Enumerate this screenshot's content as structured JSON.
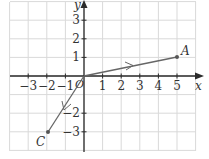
{
  "diagram": {
    "type": "coordinate-plane-vectors",
    "axes": {
      "x_label": "x",
      "y_label": "y",
      "x_ticks": [
        {
          "value": -3,
          "label": "−3"
        },
        {
          "value": -2,
          "label": "−2"
        },
        {
          "value": -1,
          "label": "−1"
        },
        {
          "value": 1,
          "label": "1"
        },
        {
          "value": 2,
          "label": "2"
        },
        {
          "value": 3,
          "label": "3"
        },
        {
          "value": 4,
          "label": "4"
        },
        {
          "value": 5,
          "label": "5"
        }
      ],
      "y_ticks": [
        {
          "value": 3,
          "label": "3"
        },
        {
          "value": 2,
          "label": "2"
        },
        {
          "value": 1,
          "label": "1"
        },
        {
          "value": -2,
          "label": "−2"
        },
        {
          "value": -3,
          "label": "−3"
        }
      ],
      "origin_label": "O",
      "x_range": [
        -4,
        6
      ],
      "y_range": [
        -4,
        4
      ]
    },
    "points": [
      {
        "name": "A",
        "x": 5,
        "y": 1
      },
      {
        "name": "C",
        "x": -2,
        "y": -3
      }
    ],
    "segments": [
      {
        "from": "O",
        "to": "A",
        "arrow": true
      },
      {
        "from": "O",
        "to": "C",
        "arrow": true
      }
    ],
    "colors": {
      "grid": "#d9d9d9",
      "axis": "#2b2b2b",
      "segment": "#666666",
      "text": "#333333"
    }
  }
}
